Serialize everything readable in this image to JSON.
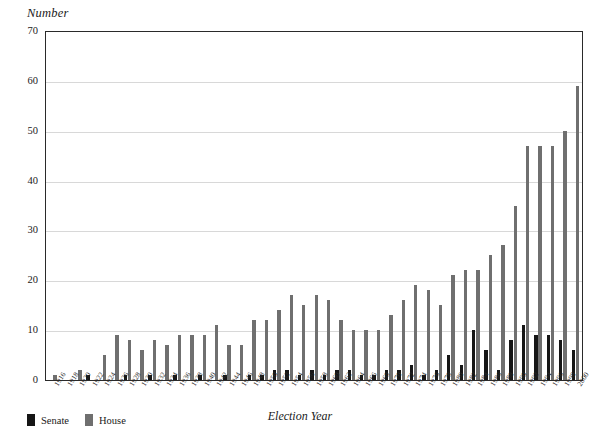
{
  "chart_data": {
    "type": "bar",
    "title": "",
    "ylabel": "Number",
    "xlabel": "Election Year",
    "ylim": [
      0,
      70
    ],
    "ytick_step": 10,
    "yticks": [
      "0",
      "10",
      "20",
      "30",
      "40",
      "50",
      "60",
      "70"
    ],
    "grid": true,
    "legend_position": "below-axis-left",
    "colors": {
      "senate": "#161616",
      "house": "#6f6f6f",
      "gridline": "#d8d8d8",
      "axis": "#2a2a2a"
    },
    "categories": [
      "1916",
      "1918",
      "1920",
      "1922",
      "1924",
      "1926",
      "1928",
      "1930",
      "1932",
      "1934",
      "1936",
      "1938",
      "1940",
      "1942",
      "1944",
      "1946",
      "1948",
      "1950",
      "1952",
      "1954",
      "1956",
      "1958",
      "1960",
      "1962",
      "1964",
      "1966",
      "1968",
      "1970",
      "1972",
      "1974",
      "1976",
      "1978",
      "1980",
      "1982",
      "1984",
      "1986",
      "1988",
      "1990",
      "1992",
      "1994",
      "1996",
      "1998",
      "2000"
    ],
    "series": [
      {
        "name": "Senate",
        "color": "#161616",
        "values": [
          0,
          0,
          0,
          1,
          0,
          0,
          1,
          0,
          1,
          0,
          1,
          0,
          1,
          0,
          1,
          0,
          1,
          1,
          2,
          2,
          1,
          2,
          1,
          2,
          2,
          1,
          1,
          2,
          2,
          3,
          1,
          2,
          5,
          3,
          10,
          6,
          2,
          8,
          11,
          9,
          9,
          8,
          6
        ]
      },
      {
        "name": "House",
        "color": "#6f6f6f",
        "values": [
          1,
          0,
          2,
          0,
          5,
          9,
          8,
          6,
          8,
          7,
          9,
          9,
          9,
          11,
          7,
          7,
          12,
          12,
          14,
          17,
          15,
          17,
          16,
          12,
          10,
          10,
          10,
          13,
          16,
          19,
          18,
          15,
          21,
          22,
          22,
          25,
          27,
          35,
          47,
          47,
          47,
          50,
          59
        ]
      }
    ],
    "bars_plotted": [
      {
        "year": "1916",
        "senate": 0,
        "house": 1
      },
      {
        "year": "1918",
        "senate": 0,
        "house": 0
      },
      {
        "year": "1920",
        "senate": 0,
        "house": 2
      },
      {
        "year": "1922",
        "senate": 1,
        "house": 0
      },
      {
        "year": "1924",
        "senate": 0,
        "house": 5
      },
      {
        "year": "1926",
        "senate": 0,
        "house": 9
      },
      {
        "year": "1928",
        "senate": 1,
        "house": 8
      },
      {
        "year": "1930",
        "senate": 0,
        "house": 6
      },
      {
        "year": "1932",
        "senate": 1,
        "house": 8
      },
      {
        "year": "1934",
        "senate": 0,
        "house": 7
      },
      {
        "year": "1936",
        "senate": 1,
        "house": 9
      },
      {
        "year": "1938",
        "senate": 0,
        "house": 9
      },
      {
        "year": "1940",
        "senate": 1,
        "house": 9
      },
      {
        "year": "1942",
        "senate": 0,
        "house": 11
      },
      {
        "year": "1944",
        "senate": 1,
        "house": 7
      },
      {
        "year": "1946",
        "senate": 0,
        "house": 7
      },
      {
        "year": "1948",
        "senate": 1,
        "house": 12
      },
      {
        "year": "1950",
        "senate": 1,
        "house": 12
      },
      {
        "year": "1952",
        "senate": 2,
        "house": 14
      },
      {
        "year": "1954",
        "senate": 2,
        "house": 17
      },
      {
        "year": "1956",
        "senate": 1,
        "house": 15
      },
      {
        "year": "1958",
        "senate": 2,
        "house": 17
      },
      {
        "year": "1960",
        "senate": 1,
        "house": 16
      },
      {
        "year": "1962",
        "senate": 2,
        "house": 12
      },
      {
        "year": "1964",
        "senate": 2,
        "house": 10
      },
      {
        "year": "1966",
        "senate": 1,
        "house": 10
      },
      {
        "year": "1968",
        "senate": 1,
        "house": 10
      },
      {
        "year": "1970",
        "senate": 2,
        "house": 13
      },
      {
        "year": "1972",
        "senate": 2,
        "house": 16
      },
      {
        "year": "1974",
        "senate": 3,
        "house": 19
      },
      {
        "year": "1976",
        "senate": 1,
        "house": 18
      },
      {
        "year": "1978",
        "senate": 2,
        "house": 15
      },
      {
        "year": "1980",
        "senate": 5,
        "house": 21
      },
      {
        "year": "1982",
        "senate": 3,
        "house": 22
      },
      {
        "year": "1984",
        "senate": 10,
        "house": 22
      },
      {
        "year": "1986",
        "senate": 6,
        "house": 25
      },
      {
        "year": "1988",
        "senate": 2,
        "house": 27
      },
      {
        "year": "1990",
        "senate": 8,
        "house": 35
      },
      {
        "year": "1992",
        "senate": 11,
        "house": 47
      },
      {
        "year": "1994",
        "senate": 9,
        "house": 47
      },
      {
        "year": "1996",
        "senate": 9,
        "house": 47
      },
      {
        "year": "1998",
        "senate": 8,
        "house": 50
      },
      {
        "year": "2000",
        "senate": 6,
        "house": 59
      }
    ]
  },
  "legend": {
    "senate_label": "Senate",
    "house_label": "House"
  }
}
